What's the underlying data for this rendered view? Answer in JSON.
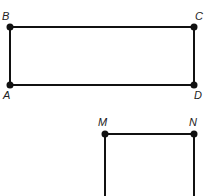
{
  "diagram": {
    "type": "geometry-figures",
    "colors": {
      "line": "#111111",
      "point": "#111111",
      "label": "#222222",
      "background": "#ffffff"
    },
    "rectangle_abcd": {
      "points": [
        {
          "name": "A",
          "x": 10,
          "y": 85
        },
        {
          "name": "B",
          "x": 10,
          "y": 27
        },
        {
          "name": "C",
          "x": 194,
          "y": 27
        },
        {
          "name": "D",
          "x": 194,
          "y": 85
        }
      ],
      "labels": {
        "A": "A",
        "B": "B",
        "C": "C",
        "D": "D"
      }
    },
    "figure_mn": {
      "points": [
        {
          "name": "M",
          "x": 105,
          "y": 134
        },
        {
          "name": "N",
          "x": 194,
          "y": 134
        }
      ],
      "labels": {
        "M": "M",
        "N": "N"
      }
    }
  }
}
